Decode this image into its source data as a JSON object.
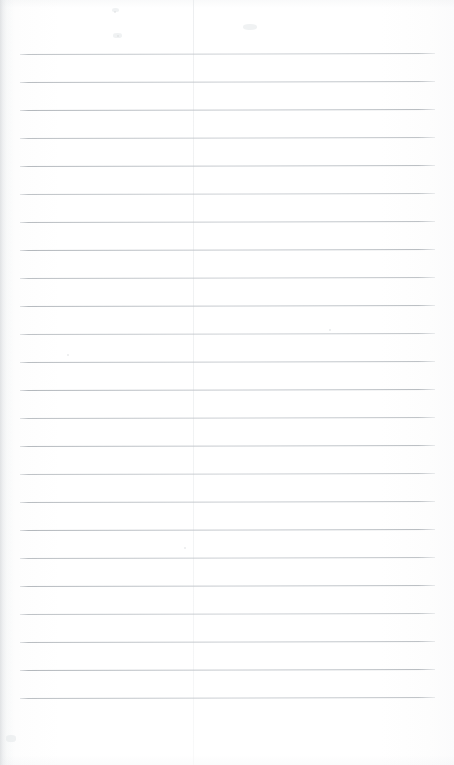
{
  "document": {
    "kind": "scanned-lined-notebook-page",
    "title": "Blank Ruled Page",
    "content_text": "",
    "page_width": 454,
    "page_height": 765,
    "background_color": "#fdfdfd",
    "paper_tone": "#ffffff"
  },
  "ruling": {
    "line_color": "#c4c8cc",
    "line_thickness_px": 1,
    "line_count": 24,
    "line_spacing_px": 28,
    "first_line_y": 54,
    "last_line_y": 698,
    "line_start_x": 20,
    "line_end_x": 435,
    "tilt_degrees": -0.13,
    "lines_y": [
      54,
      82,
      110,
      138,
      166,
      194,
      222,
      250,
      278,
      306,
      334,
      362,
      390,
      418,
      446,
      474,
      502,
      530,
      558,
      586,
      614,
      642,
      670,
      698
    ]
  },
  "margin_rule": {
    "label": "vertical margin line",
    "color": "#f0f1f2",
    "x": 193,
    "top": 0,
    "bottom": 765,
    "thickness_px": 1
  },
  "header_area": {
    "label": "unruled header margin",
    "top": 0,
    "height": 54
  },
  "footer_area": {
    "label": "unruled footer margin",
    "top": 698,
    "height": 67
  },
  "scan_artifacts": {
    "left_edge_shadow": true,
    "left_edge_color": "#babec2",
    "speckles": [
      {
        "x": 115,
        "y": 12,
        "r": 1.4
      },
      {
        "x": 118,
        "y": 36,
        "r": 1.1
      },
      {
        "x": 68,
        "y": 355,
        "r": 1.0
      },
      {
        "x": 185,
        "y": 548,
        "r": 1.0
      },
      {
        "x": 330,
        "y": 330,
        "r": 0.9
      }
    ],
    "smudges": [
      {
        "x": 112,
        "y": 8,
        "w": 7,
        "h": 4
      },
      {
        "x": 113,
        "y": 33,
        "w": 9,
        "h": 5
      },
      {
        "x": 6,
        "y": 735,
        "w": 10,
        "h": 7
      },
      {
        "x": 243,
        "y": 24,
        "w": 14,
        "h": 6
      }
    ]
  }
}
